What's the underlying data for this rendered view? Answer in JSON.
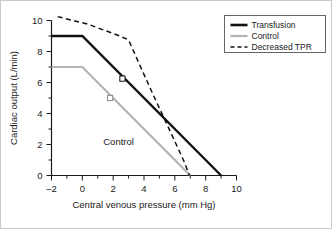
{
  "chart_data": {
    "type": "line",
    "title": "",
    "xlabel": "Central venous pressure (mm Hg)",
    "ylabel": "Cardiac output (L/min)",
    "xlim": [
      -2,
      10
    ],
    "ylim": [
      0,
      10
    ],
    "xticks": [
      -2,
      0,
      2,
      4,
      6,
      8,
      10
    ],
    "xtick_labels": [
      "–2",
      "0",
      "2",
      "4",
      "6",
      "8",
      "10"
    ],
    "yticks": [
      0,
      2,
      4,
      6,
      8,
      10
    ],
    "ytick_labels": [
      "0",
      "2",
      "4",
      "6",
      "8",
      "10"
    ],
    "minor_tick_step": 1,
    "grid": false,
    "legend_position": "top-right",
    "series": [
      {
        "name": "Transfusion",
        "style": "solid",
        "color": "#111111",
        "width": 2.4,
        "points": [
          [
            -2,
            9.0
          ],
          [
            0,
            9.0
          ],
          [
            9,
            0
          ]
        ],
        "markers": [
          [
            2.6,
            6.25
          ]
        ]
      },
      {
        "name": "Control",
        "style": "solid",
        "color": "#b4b4b4",
        "width": 2.2,
        "points": [
          [
            -2,
            7.0
          ],
          [
            0,
            7.0
          ],
          [
            7,
            0
          ]
        ],
        "markers": [
          [
            1.8,
            5.0
          ]
        ]
      },
      {
        "name": "Decreased TPR",
        "style": "dashed",
        "color": "#111111",
        "width": 1.5,
        "points": [
          [
            -1.6,
            10.25
          ],
          [
            0.4,
            9.75
          ],
          [
            2.3,
            9.05
          ],
          [
            3.0,
            8.75
          ],
          [
            3.6,
            7.4
          ],
          [
            4.6,
            5.2
          ],
          [
            5.7,
            2.85
          ],
          [
            6.6,
            0.9
          ],
          [
            6.95,
            0
          ]
        ],
        "markers": []
      }
    ],
    "annotations": [
      {
        "text": "Control",
        "x": 2.35,
        "y": 1.95
      }
    ]
  },
  "legend": {
    "entries": [
      {
        "label": "Transfusion"
      },
      {
        "label": "Control"
      },
      {
        "label": "Decreased TPR"
      }
    ]
  },
  "colors": {
    "transfusion": "#111111",
    "control": "#b4b4b4",
    "decreased_tpr": "#111111",
    "axis": "#1a1a1a",
    "frame": "#c9c9c9"
  }
}
